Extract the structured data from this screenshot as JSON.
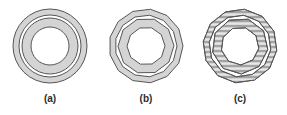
{
  "figure": {
    "colors": {
      "fill": "#d4d4d4",
      "stroke": "#555555",
      "stripe": "#6a6a6a",
      "background": "#ffffff"
    },
    "ring_radii": {
      "outer_band": [
        37,
        31
      ],
      "inner_band": [
        28,
        19
      ]
    },
    "panels": [
      {
        "id": "a",
        "label": "(a)",
        "center": [
          50,
          46
        ],
        "style": "circle",
        "sides": 0,
        "stripes": false
      },
      {
        "id": "b",
        "label": "(b)",
        "center": [
          146,
          46
        ],
        "style": "polygon",
        "sides_outer": 13,
        "sides_inner": 10,
        "stripes": false
      },
      {
        "id": "c",
        "label": "(c)",
        "center": [
          240,
          46
        ],
        "style": "polygon",
        "sides_outer": 12,
        "sides_inner": 9,
        "stripes": true,
        "stripe_spacing": 5
      }
    ]
  }
}
